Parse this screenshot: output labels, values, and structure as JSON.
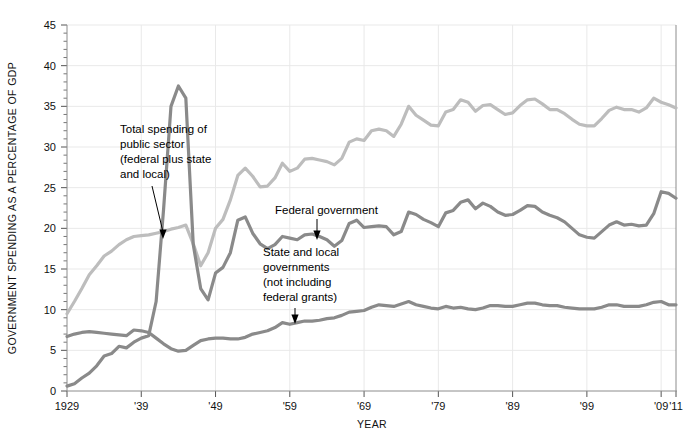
{
  "chart_data": {
    "type": "line",
    "title": "",
    "xlabel": "YEAR",
    "ylabel": "GOVERNMENT SPENDING AS A PERCENTAGE OF GDP",
    "xlim": [
      1929,
      2011
    ],
    "ylim": [
      0,
      45
    ],
    "grid": true,
    "legend_position": "inline-annotations",
    "y_ticks": [
      0,
      5,
      10,
      15,
      20,
      25,
      30,
      35,
      40,
      45
    ],
    "y_tick_labels": [
      "0",
      "5",
      "10",
      "15",
      "20",
      "25",
      "30",
      "35",
      "40",
      "45"
    ],
    "y_minor_tick_step": 1,
    "x_ticks": [
      1929,
      1939,
      1949,
      1959,
      1969,
      1979,
      1989,
      1999,
      2009,
      2011
    ],
    "x_tick_labels": [
      "1929",
      "'39",
      "'49",
      "'59",
      "'69",
      "'79",
      "'89",
      "'99",
      "'09",
      "'11"
    ],
    "x": [
      1929,
      1930,
      1931,
      1932,
      1933,
      1934,
      1935,
      1936,
      1937,
      1938,
      1939,
      1940,
      1941,
      1942,
      1943,
      1944,
      1945,
      1946,
      1947,
      1948,
      1949,
      1950,
      1951,
      1952,
      1953,
      1954,
      1955,
      1956,
      1957,
      1958,
      1959,
      1960,
      1961,
      1962,
      1963,
      1964,
      1965,
      1966,
      1967,
      1968,
      1969,
      1970,
      1971,
      1972,
      1973,
      1974,
      1975,
      1976,
      1977,
      1978,
      1979,
      1980,
      1981,
      1982,
      1983,
      1984,
      1985,
      1986,
      1987,
      1988,
      1989,
      1990,
      1991,
      1992,
      1993,
      1994,
      1995,
      1996,
      1997,
      1998,
      1999,
      2000,
      2001,
      2002,
      2003,
      2004,
      2005,
      2006,
      2007,
      2008,
      2009,
      2010,
      2011
    ],
    "series": [
      {
        "name": "Total spending of public sector (federal plus state and local)",
        "color": "#bdbdbd",
        "values": [
          9.5,
          11.0,
          12.6,
          14.3,
          15.4,
          16.6,
          17.2,
          18.0,
          18.6,
          19.0,
          19.1,
          19.2,
          19.4,
          19.6,
          19.9,
          20.1,
          20.4,
          18.1,
          15.4,
          17.0,
          20.0,
          21.1,
          23.5,
          26.5,
          27.4,
          26.4,
          25.1,
          25.2,
          26.2,
          28.0,
          27.0,
          27.4,
          28.5,
          28.6,
          28.4,
          28.2,
          27.8,
          28.6,
          30.6,
          31.0,
          30.8,
          32.0,
          32.2,
          32.0,
          31.3,
          32.8,
          35.0,
          33.9,
          33.3,
          32.7,
          32.6,
          34.3,
          34.6,
          35.8,
          35.5,
          34.4,
          35.1,
          35.2,
          34.6,
          34.0,
          34.2,
          35.1,
          35.8,
          35.9,
          35.3,
          34.6,
          34.6,
          34.1,
          33.4,
          32.8,
          32.6,
          32.6,
          33.5,
          34.5,
          34.9,
          34.6,
          34.6,
          34.3,
          34.8,
          36.0,
          35.5,
          35.2,
          34.8
        ]
      },
      {
        "name": "Federal government",
        "color": "#8a8a8a",
        "values": [
          0.6,
          0.9,
          1.6,
          2.2,
          3.1,
          4.3,
          4.6,
          5.5,
          5.3,
          6.0,
          6.5,
          6.8,
          11.0,
          22.3,
          35.0,
          37.5,
          36.0,
          18.0,
          12.6,
          11.2,
          14.5,
          15.2,
          17.0,
          21.0,
          21.4,
          19.4,
          18.1,
          17.5,
          18.0,
          19.0,
          18.8,
          18.6,
          19.2,
          19.3,
          19.0,
          18.6,
          17.8,
          18.5,
          20.6,
          21.0,
          20.1,
          20.2,
          20.3,
          20.2,
          19.2,
          19.6,
          22.0,
          21.7,
          21.1,
          20.7,
          20.2,
          21.9,
          22.2,
          23.2,
          23.5,
          22.4,
          23.1,
          22.7,
          22.0,
          21.6,
          21.7,
          22.2,
          22.8,
          22.7,
          22.0,
          21.6,
          21.3,
          20.8,
          20.0,
          19.2,
          18.9,
          18.8,
          19.6,
          20.4,
          20.8,
          20.4,
          20.5,
          20.3,
          20.4,
          21.8,
          24.5,
          24.3,
          23.7
        ]
      },
      {
        "name": "State and local governments (not including federal grants)",
        "color": "#8a8a8a",
        "values": [
          6.7,
          7.0,
          7.2,
          7.3,
          7.2,
          7.1,
          7.0,
          6.9,
          6.8,
          7.5,
          7.4,
          7.2,
          6.5,
          5.8,
          5.2,
          4.9,
          5.0,
          5.6,
          6.2,
          6.4,
          6.5,
          6.5,
          6.4,
          6.4,
          6.6,
          7.0,
          7.2,
          7.4,
          7.8,
          8.4,
          8.2,
          8.4,
          8.6,
          8.6,
          8.7,
          8.9,
          9.0,
          9.3,
          9.7,
          9.8,
          9.9,
          10.3,
          10.6,
          10.5,
          10.4,
          10.7,
          11.0,
          10.6,
          10.4,
          10.2,
          10.1,
          10.4,
          10.2,
          10.3,
          10.1,
          10.0,
          10.2,
          10.5,
          10.5,
          10.4,
          10.4,
          10.6,
          10.8,
          10.8,
          10.6,
          10.5,
          10.5,
          10.3,
          10.2,
          10.1,
          10.1,
          10.1,
          10.3,
          10.6,
          10.6,
          10.4,
          10.4,
          10.4,
          10.6,
          10.9,
          11.0,
          10.6,
          10.6
        ]
      }
    ],
    "annotations": [
      {
        "id": "total-spending",
        "lines": [
          "Total spending of",
          "public sector",
          "(federal plus state",
          "and local)"
        ],
        "target_year": 1940,
        "target_value": 19.2
      },
      {
        "id": "federal-government",
        "lines": [
          "Federal government"
        ],
        "target_year": 1961,
        "target_value": 19.2
      },
      {
        "id": "state-local",
        "lines": [
          "State and local",
          "governments",
          "(not including",
          "federal grants)"
        ],
        "target_year": 1960,
        "target_value": 8.4
      }
    ]
  }
}
